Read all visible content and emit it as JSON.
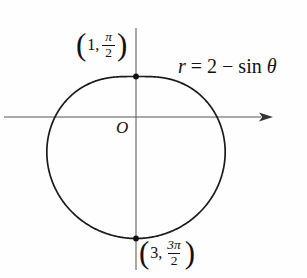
{
  "figure": {
    "origin_label": "O",
    "equation": {
      "lhs": "r",
      "equals": "=",
      "const": "2",
      "minus": "−",
      "func": "sin",
      "var": "θ"
    },
    "labels": {
      "top": {
        "open": "(",
        "pre": "1,",
        "num": "π",
        "den": "2",
        "close": ")"
      },
      "bottom": {
        "open": "(",
        "pre": "3,",
        "num": "3π",
        "den": "2",
        "close": ")"
      }
    }
  },
  "chart_data": {
    "type": "line",
    "coordinate_system": "polar",
    "title": "",
    "equation_text": "r = 2 − sin θ",
    "polar": {
      "a": 2,
      "b": -1,
      "trig": "sin"
    },
    "theta_range_rad": [
      0,
      6.2832
    ],
    "key_points": [
      {
        "label": "(1, π/2)",
        "r": 1,
        "theta": "π/2",
        "theta_rad": 1.5708,
        "cartesian": [
          0,
          1
        ]
      },
      {
        "label": "(3, 3π/2)",
        "r": 3,
        "theta": "3π/2",
        "theta_rad": 4.7124,
        "cartesian": [
          0,
          -3
        ]
      }
    ],
    "axis_intercepts": {
      "x": [
        [
          -2,
          0
        ],
        [
          2,
          0
        ]
      ],
      "y": [
        [
          0,
          1
        ],
        [
          0,
          -3
        ]
      ]
    },
    "axes": {
      "x_visible_range": [
        -3.25,
        3.4
      ],
      "y_visible_range": [
        -3.8,
        2.2
      ],
      "arrow": "x-positive",
      "origin_label": "O"
    },
    "grid": false,
    "legend": false,
    "curve_color": "#1a1a1a",
    "axis_color": "#555555",
    "marker_color": "#111111",
    "background": "#fefefe"
  }
}
